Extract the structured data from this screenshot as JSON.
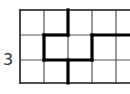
{
  "row_label": "3",
  "grid": {
    "columns_x": [
      20,
      44,
      68,
      92,
      116,
      140
    ],
    "rows_y": [
      10,
      35,
      60,
      83
    ],
    "thin_color": "#555555",
    "thick_color": "#000000"
  },
  "thick_path": [
    {
      "x1": 68,
      "y1": 10,
      "x2": 68,
      "y2": 35
    },
    {
      "x1": 44,
      "y1": 35,
      "x2": 68,
      "y2": 35
    },
    {
      "x1": 44,
      "y1": 35,
      "x2": 44,
      "y2": 60
    },
    {
      "x1": 44,
      "y1": 60,
      "x2": 92,
      "y2": 60
    },
    {
      "x1": 92,
      "y1": 35,
      "x2": 92,
      "y2": 60
    },
    {
      "x1": 92,
      "y1": 35,
      "x2": 130,
      "y2": 35
    },
    {
      "x1": 68,
      "y1": 60,
      "x2": 68,
      "y2": 83
    }
  ]
}
